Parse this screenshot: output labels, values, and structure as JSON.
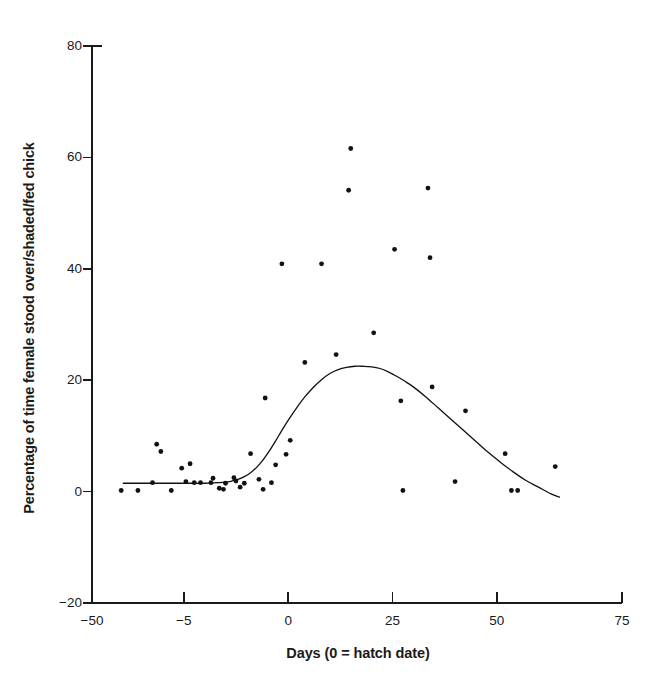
{
  "chart_data": {
    "type": "scatter",
    "title": "",
    "xlabel": "Days (0 = hatch date)",
    "ylabel": "Percentage of time female stood over/shaded/fed chick",
    "xlim": [
      -47,
      80
    ],
    "ylim": [
      -20,
      80
    ],
    "xticks": [
      -50,
      -5,
      0,
      25,
      50,
      75
    ],
    "xtick_labels": [
      "-50",
      "-5",
      "0",
      "25",
      "50",
      "75"
    ],
    "xtick_positions": [
      -47,
      -25,
      0,
      25,
      50,
      80
    ],
    "yticks": [
      -20,
      0,
      20,
      40,
      60,
      80
    ],
    "ytick_labels": [
      "-20",
      "0",
      "20",
      "40",
      "60",
      "80"
    ],
    "grid": false,
    "legend": null,
    "marker": {
      "shape": "circle",
      "color": "#111111",
      "size": 4.6
    },
    "points": [
      {
        "x": -40.0,
        "y": 0.2
      },
      {
        "x": -36.0,
        "y": 0.2
      },
      {
        "x": -32.5,
        "y": 1.6
      },
      {
        "x": -31.5,
        "y": 8.5
      },
      {
        "x": -30.5,
        "y": 7.2
      },
      {
        "x": -28.0,
        "y": 0.2
      },
      {
        "x": -25.5,
        "y": 4.2
      },
      {
        "x": -24.5,
        "y": 1.8
      },
      {
        "x": -23.5,
        "y": 5.0
      },
      {
        "x": -22.5,
        "y": 1.6
      },
      {
        "x": -21.0,
        "y": 1.6
      },
      {
        "x": -18.5,
        "y": 1.6
      },
      {
        "x": -18.0,
        "y": 2.4
      },
      {
        "x": -16.5,
        "y": 0.6
      },
      {
        "x": -15.5,
        "y": 0.4
      },
      {
        "x": -15.0,
        "y": 1.5
      },
      {
        "x": -13.0,
        "y": 2.5
      },
      {
        "x": -12.5,
        "y": 1.9
      },
      {
        "x": -11.5,
        "y": 0.8
      },
      {
        "x": -10.5,
        "y": 1.5
      },
      {
        "x": -9.0,
        "y": 6.8
      },
      {
        "x": -7.0,
        "y": 2.2
      },
      {
        "x": -6.0,
        "y": 0.4
      },
      {
        "x": -5.5,
        "y": 16.8
      },
      {
        "x": -4.0,
        "y": 1.6
      },
      {
        "x": -3.0,
        "y": 4.8
      },
      {
        "x": -1.5,
        "y": 40.9
      },
      {
        "x": -0.5,
        "y": 6.7
      },
      {
        "x": 0.5,
        "y": 9.2
      },
      {
        "x": 4.0,
        "y": 23.2
      },
      {
        "x": 8.0,
        "y": 40.9
      },
      {
        "x": 11.5,
        "y": 24.6
      },
      {
        "x": 14.5,
        "y": 54.1
      },
      {
        "x": 15.0,
        "y": 61.6
      },
      {
        "x": 20.5,
        "y": 28.5
      },
      {
        "x": 25.5,
        "y": 43.5
      },
      {
        "x": 27.0,
        "y": 16.3
      },
      {
        "x": 27.5,
        "y": 0.2
      },
      {
        "x": 33.5,
        "y": 54.5
      },
      {
        "x": 34.0,
        "y": 42.0
      },
      {
        "x": 34.5,
        "y": 18.8
      },
      {
        "x": 40.0,
        "y": 1.8
      },
      {
        "x": 42.5,
        "y": 14.5
      },
      {
        "x": 52.0,
        "y": 6.8
      },
      {
        "x": 53.5,
        "y": 0.2
      },
      {
        "x": 55.0,
        "y": 0.2
      },
      {
        "x": 64.0,
        "y": 4.5
      }
    ],
    "fit_curve": {
      "name": "fitted curve",
      "color": "#111111",
      "width": 1.3,
      "x": [
        -39.5,
        -34,
        -29,
        -24,
        -20,
        -17,
        -15,
        -13.5,
        -12,
        -10.5,
        -9,
        -7.5,
        -6,
        -4.5,
        -3,
        -1.5,
        0,
        2,
        4,
        6,
        8,
        10,
        12,
        14,
        16,
        18,
        20,
        22,
        24,
        26,
        28,
        30,
        33,
        36,
        39,
        42,
        45,
        48,
        51,
        54,
        57,
        60,
        63,
        65
      ],
      "y": [
        1.5,
        1.5,
        1.5,
        1.5,
        1.5,
        1.6,
        1.7,
        1.9,
        2.2,
        2.7,
        3.4,
        4.4,
        5.7,
        7.3,
        9.1,
        11.0,
        12.8,
        15.0,
        17.0,
        18.7,
        20.1,
        21.2,
        21.9,
        22.3,
        22.5,
        22.5,
        22.4,
        22.1,
        21.5,
        20.7,
        19.8,
        18.8,
        17.0,
        15.0,
        13.0,
        11.0,
        9.0,
        7.0,
        5.2,
        3.5,
        2.0,
        0.8,
        -0.4,
        -1.0
      ]
    }
  },
  "axes": {
    "line_color": "#1a1a1a",
    "line_width": 1.6
  }
}
